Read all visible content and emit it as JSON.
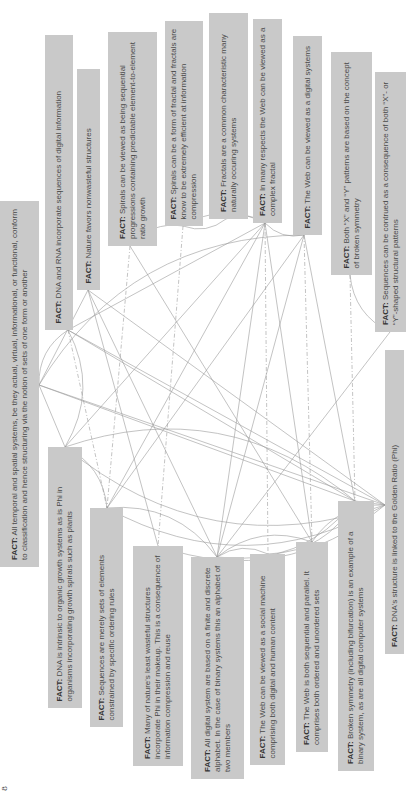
{
  "fact_label": "FACT:",
  "page_number": "8",
  "colors": {
    "box": "#c9c9c9",
    "text": "#4a4a4a",
    "line": "#9a9a9a"
  },
  "facts": [
    {
      "id": "temporal",
      "text": "All temporal and spatial systems, be they actual, virtual, informational, or functional, conform to classification and hence structuring via the notion of sets of one form or another",
      "box": [
        0,
        201,
        39,
        567
      ],
      "anchor": [
        39,
        385
      ]
    },
    {
      "id": "dna_rna",
      "text": "DNA and RNA incorporate sequences of digital information",
      "box": [
        45,
        35,
        73,
        330
      ],
      "anchor": [
        68,
        330
      ]
    },
    {
      "id": "nature_nonwasteful",
      "text": "Nature favors nonwasteful structures",
      "box": [
        77,
        69,
        100,
        290
      ],
      "anchor": [
        88,
        290
      ]
    },
    {
      "id": "spirals_sequential",
      "text": "Spirals can be viewed as being sequential progressions containing predictable element-to-element ratio growth",
      "box": [
        108,
        32,
        157,
        246
      ],
      "anchor": [
        130,
        246
      ]
    },
    {
      "id": "spirals_fractal",
      "text": "Spirals can be a form of fractal and fractals are know to be extremely efficient at information compression",
      "box": [
        165,
        21,
        203,
        226
      ],
      "anchor": [
        183,
        226
      ]
    },
    {
      "id": "fractals_common",
      "text": "Fractals are a common characteristic many naturally occuring systems",
      "box": [
        209,
        13,
        248,
        219
      ],
      "anchor": [
        226,
        219
      ]
    },
    {
      "id": "web_fractal",
      "text": "In many respects the Web can be viewed as a complex fractal",
      "box": [
        253,
        19,
        282,
        223
      ],
      "anchor": [
        265,
        223
      ]
    },
    {
      "id": "web_digital",
      "text": "The Web can be viewed as a digital systems",
      "box": [
        293,
        36,
        322,
        235
      ],
      "anchor": [
        304,
        235
      ]
    },
    {
      "id": "xy_patterns",
      "text": "Both “X” and “Y” patterns are based on the concept of broken symmetry",
      "box": [
        331,
        52,
        372,
        275
      ],
      "anchor": [
        350,
        275
      ]
    },
    {
      "id": "sequences_xy",
      "text": "Sequences can be contrued as a consequence of both “X”- or “Y”-shaped structural patterns",
      "box": [
        375,
        72,
        406,
        332
      ],
      "anchor": [
        390,
        332
      ]
    },
    {
      "id": "dna_phi",
      "text": "DNA is intrinsic to organic growth systems as is Phi in organisms incorporating growth spirals such as plants",
      "box": [
        48,
        447,
        82,
        708
      ],
      "anchor": [
        65,
        447
      ]
    },
    {
      "id": "sequences_sets",
      "text": "Sequences are merely sets of elements constrained by specific ordering rules",
      "box": [
        90,
        508,
        123,
        727
      ],
      "anchor": [
        107,
        508
      ]
    },
    {
      "id": "least_wasteful",
      "text": "Many of nature's least wasteful structures incorporate Phi in their makeup. This is a consequence of information compression and reuse",
      "box": [
        133,
        546,
        183,
        766
      ],
      "anchor": [
        158,
        546
      ]
    },
    {
      "id": "digital_alphabet",
      "text": "All digital system are based on a finite and discrete alphabet. In the case of binary systems this an alphabet of two members",
      "box": [
        191,
        557,
        244,
        779
      ],
      "anchor": [
        217,
        557
      ]
    },
    {
      "id": "web_social",
      "text": "The Web can be viewed as a social machine comprising both digital and human content",
      "box": [
        250,
        554,
        285,
        765
      ],
      "anchor": [
        268,
        554
      ]
    },
    {
      "id": "web_sequential",
      "text": "The Web is both sequential and parallel. It comprises both ordered and unordered sets",
      "box": [
        296,
        542,
        328,
        752
      ],
      "anchor": [
        312,
        542
      ]
    },
    {
      "id": "broken_symmetry",
      "text": "Broken symmetry (including bifurcation) is an example of a binary system, as are all digital computer systems",
      "box": [
        338,
        501,
        374,
        771
      ],
      "anchor": [
        355,
        501
      ]
    },
    {
      "id": "dna_golden",
      "text": "DNA's structure is linked to the Golden Ratio (Phi)",
      "box": [
        385,
        350,
        404,
        654
      ],
      "anchor": [
        385,
        505
      ]
    }
  ],
  "links": [
    [
      "temporal",
      "dna_rna",
      "arc"
    ],
    [
      "temporal",
      "nature_nonwasteful",
      "line"
    ],
    [
      "temporal",
      "web_digital",
      "arc"
    ],
    [
      "temporal",
      "dna_phi",
      "line"
    ],
    [
      "temporal",
      "broken_symmetry",
      "line"
    ],
    [
      "temporal",
      "dna_golden",
      "line"
    ],
    [
      "dna_rna",
      "dna_phi",
      "arc"
    ],
    [
      "dna_rna",
      "web_fractal",
      "line"
    ],
    [
      "dna_rna",
      "broken_symmetry",
      "line"
    ],
    [
      "dna_rna",
      "dna_golden",
      "line"
    ],
    [
      "dna_rna",
      "sequences_sets",
      "dash"
    ],
    [
      "nature_nonwasteful",
      "least_wasteful",
      "line"
    ],
    [
      "nature_nonwasteful",
      "dna_golden",
      "line"
    ],
    [
      "nature_nonwasteful",
      "digital_alphabet",
      "line"
    ],
    [
      "spirals_sequential",
      "spirals_fractal",
      "arc"
    ],
    [
      "spirals_sequential",
      "sequences_sets",
      "dash"
    ],
    [
      "spirals_sequential",
      "web_sequential",
      "line"
    ],
    [
      "spirals_fractal",
      "fractals_common",
      "arc"
    ],
    [
      "spirals_fractal",
      "web_fractal",
      "arc"
    ],
    [
      "spirals_fractal",
      "least_wasteful",
      "dash"
    ],
    [
      "fractals_common",
      "web_fractal",
      "arc"
    ],
    [
      "web_fractal",
      "web_digital",
      "arc"
    ],
    [
      "web_fractal",
      "dna_phi",
      "line"
    ],
    [
      "web_fractal",
      "digital_alphabet",
      "line"
    ],
    [
      "web_fractal",
      "web_social",
      "dash"
    ],
    [
      "web_fractal",
      "web_sequential",
      "line"
    ],
    [
      "web_fractal",
      "sequences_sets",
      "line"
    ],
    [
      "web_digital",
      "digital_alphabet",
      "line"
    ],
    [
      "web_digital",
      "web_sequential",
      "dash"
    ],
    [
      "web_digital",
      "broken_symmetry",
      "line"
    ],
    [
      "web_digital",
      "sequences_sets",
      "line"
    ],
    [
      "xy_patterns",
      "sequences_xy",
      "arc"
    ],
    [
      "xy_patterns",
      "broken_symmetry",
      "dash"
    ],
    [
      "sequences_xy",
      "digital_alphabet",
      "line"
    ],
    [
      "dna_phi",
      "broken_symmetry",
      "arc"
    ],
    [
      "dna_phi",
      "dna_golden",
      "arc"
    ],
    [
      "dna_phi",
      "sequences_sets",
      "arc"
    ],
    [
      "sequences_sets",
      "dna_golden",
      "arc"
    ],
    [
      "sequences_sets",
      "digital_alphabet",
      "arc"
    ],
    [
      "least_wasteful",
      "dna_golden",
      "arc"
    ],
    [
      "digital_alphabet",
      "web_social",
      "arc"
    ],
    [
      "digital_alphabet",
      "broken_symmetry",
      "arc"
    ],
    [
      "digital_alphabet",
      "web_sequential",
      "arc"
    ],
    [
      "web_social",
      "broken_symmetry",
      "arc"
    ],
    [
      "web_sequential",
      "dna_golden",
      "arc"
    ],
    [
      "broken_symmetry",
      "dna_golden",
      "line"
    ]
  ]
}
